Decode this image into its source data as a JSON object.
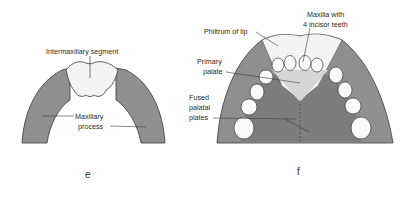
{
  "colors": {
    "background": "#ffffff",
    "tissue_gray": "#8f8f8f",
    "tissue_gray_dark": "#7d7d7d",
    "white_region": "#f4f4f4",
    "tooth_fill": "#fafafa",
    "outline": "#3a3a3a",
    "text": "#2a2a2a"
  },
  "panel_e": {
    "letter": "e",
    "labels": {
      "intermaxillary_segment": "Intermaxillary segment",
      "maxillary_line1": "Maxillary",
      "maxillary_line2": "process"
    }
  },
  "panel_f": {
    "letter": "f",
    "labels": {
      "philtrum": "Philtrum of lip",
      "maxilla_line1": "Maxilla with",
      "maxilla_line2": "4 incisor teeth",
      "primary_line1": "Primary",
      "primary_line2": "palate",
      "fused_line1": "Fused",
      "fused_line2": "palatal",
      "fused_line3": "plates"
    },
    "incisor_count": 4,
    "teeth_per_side_lateral": 4
  }
}
